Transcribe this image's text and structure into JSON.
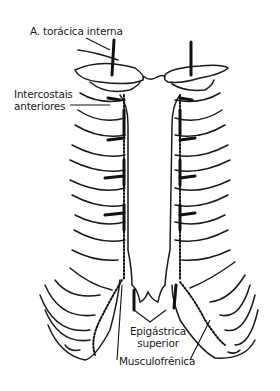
{
  "figure": {
    "labels": {
      "internal_thoracic": "A. torácica interna",
      "intercostals_line1": "Intercostais",
      "intercostals_line2": "anteriores",
      "epigastric_line1": "Epigástrica",
      "epigastric_line2": "superior",
      "musculophrenic": "Musculofrênica"
    },
    "colors": {
      "line": "#1a1a1a",
      "background": "#ffffff"
    }
  }
}
